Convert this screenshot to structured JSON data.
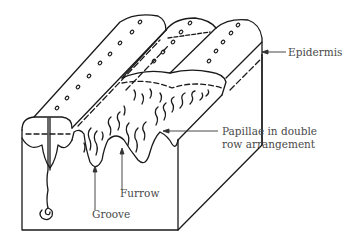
{
  "figure": {
    "labels": {
      "epidermis": "Epidermis",
      "papillae_line1": "Papillae in double",
      "papillae_line2": "row arrangement",
      "furrow": "Furrow",
      "groove": "Groove"
    },
    "colors": {
      "line": "#1a1a1a",
      "text": "#4a4a4a",
      "background": "#ffffff"
    }
  }
}
